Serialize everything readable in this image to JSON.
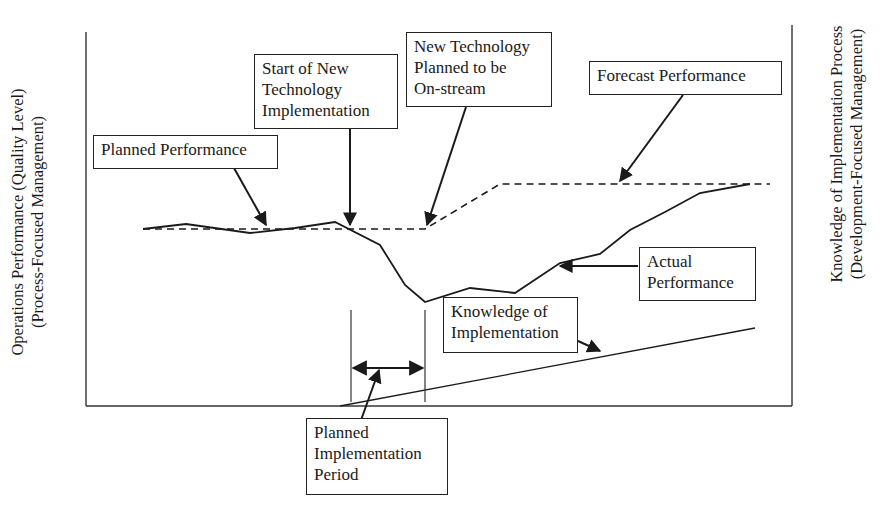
{
  "diagram": {
    "axes": {
      "left_label": "Operations Performance (Quality Level)\n(Process-Focused Management)",
      "right_label": "Knowledge of Implementation Process\n(Development-Focused Management)"
    },
    "callouts": {
      "planned_performance": "Planned Performance",
      "start_implementation": "Start of New\nTechnology\nImplementation",
      "planned_onstream": "New Technology\nPlanned to be\nOn-stream",
      "forecast_performance": "Forecast Performance",
      "actual_performance": "Actual\nPerformance",
      "knowledge_of_implementation": "Knowledge of\nImplementation",
      "planned_implementation_period": "Planned\nImplementation\nPeriod"
    },
    "series": {
      "planned_performance_dashed": [
        [
          143,
          229
        ],
        [
          425,
          229
        ],
        [
          500,
          184
        ],
        [
          770,
          184
        ]
      ],
      "actual_performance_solid": [
        [
          143,
          229
        ],
        [
          186,
          224
        ],
        [
          250,
          233
        ],
        [
          295,
          228
        ],
        [
          335,
          222
        ],
        [
          380,
          245
        ],
        [
          405,
          285
        ],
        [
          425,
          302
        ],
        [
          470,
          288
        ],
        [
          515,
          293
        ],
        [
          560,
          263
        ],
        [
          600,
          254
        ],
        [
          630,
          230
        ],
        [
          665,
          212
        ],
        [
          700,
          193
        ],
        [
          750,
          184
        ]
      ],
      "knowledge_line": [
        [
          340,
          406
        ],
        [
          755,
          328
        ]
      ]
    },
    "colors": {
      "line": "#1a1a1a",
      "background": "#ffffff"
    }
  }
}
